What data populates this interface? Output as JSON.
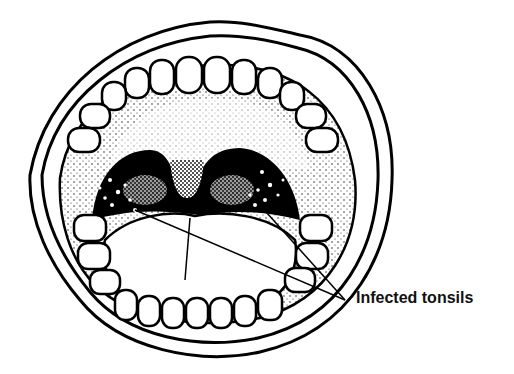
{
  "figure": {
    "label": "Infected tonsils",
    "colors": {
      "ink": "#000000",
      "paper": "#ffffff",
      "stipple": "#333333"
    }
  }
}
